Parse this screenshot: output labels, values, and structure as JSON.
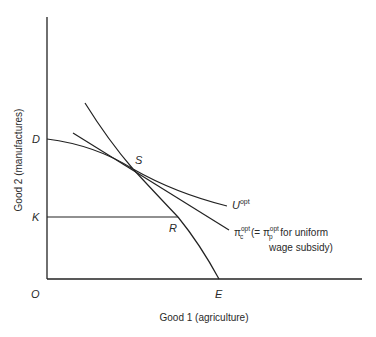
{
  "diagram": {
    "y_axis_label": "Good 2 (manufactures)",
    "x_axis_label": "Good 1 (agriculture)",
    "points": {
      "origin": "O",
      "D": "D",
      "K": "K",
      "S": "S",
      "R": "R",
      "E": "E"
    },
    "curves": {
      "utility": {
        "base": "U",
        "sup": "opt"
      },
      "price_line": {
        "base": "π",
        "sub": "c",
        "sup": "opt",
        "note_part1": " (= ",
        "note_base2": "π",
        "note_sub2": "p",
        "note_sup2": "opt",
        "note_part2": " for uniform",
        "note_line2": "wage subsidy)"
      }
    }
  }
}
